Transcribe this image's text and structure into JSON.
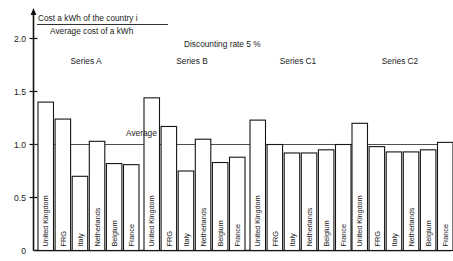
{
  "chart_data": {
    "type": "bar",
    "title_numerator": "Cost a kWh of the country i",
    "title_denominator": "Average cost of a kWh",
    "annotation_discount": "Discounting rate 5 %",
    "annotation_average": "Average",
    "xlabel": "",
    "ylabel": "",
    "ylim": [
      0,
      2.15
    ],
    "grid": false,
    "legend_position": "above-groups",
    "yticks": [
      "0",
      "0.5",
      "1.0",
      "1.5",
      "2.0"
    ],
    "ytick_values": [
      0,
      0.5,
      1.0,
      1.5,
      2.0
    ],
    "average_reference": 1.0,
    "categories": [
      "United Kingdom",
      "FRG",
      "Italy",
      "Netherlands",
      "Belgium",
      "France"
    ],
    "series": [
      {
        "name": "Series A",
        "values": [
          1.4,
          1.24,
          0.7,
          1.03,
          0.82,
          0.81
        ]
      },
      {
        "name": "Series B",
        "values": [
          1.44,
          1.17,
          0.75,
          1.05,
          0.83,
          0.88
        ]
      },
      {
        "name": "Series C1",
        "values": [
          1.23,
          1.0,
          0.92,
          0.92,
          0.95,
          1.0
        ]
      },
      {
        "name": "Series C2",
        "values": [
          1.2,
          0.98,
          0.93,
          0.93,
          0.95,
          1.02
        ]
      }
    ]
  }
}
